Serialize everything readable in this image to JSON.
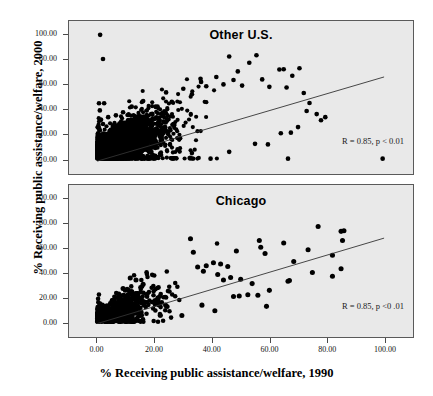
{
  "figure": {
    "xlabel": "% Receiving public assistance/welfare, 1990",
    "ylabel": "% Receiving public assistance/welfare, 2000"
  },
  "chart_data": {
    "type": "scatter",
    "title": "",
    "xlabel": "% Receiving public assistance/welfare, 1990",
    "ylabel": "% Receiving public assistance/welfare, 2000",
    "xlim": [
      -5,
      108
    ],
    "ylim": [
      -6,
      108
    ],
    "xticks": [
      "0.00",
      "20.00",
      "40.00",
      "60.00",
      "80.00",
      "100.00"
    ],
    "xtick_values": [
      0,
      20,
      40,
      60,
      80,
      100
    ],
    "yticks": [
      "0.00",
      "20.00",
      "40.00",
      "60.00",
      "80.00",
      "100.00"
    ],
    "ytick_values": [
      0,
      20,
      40,
      60,
      80,
      100
    ],
    "grid": false,
    "legend": "none",
    "panels": [
      {
        "name": "other-us",
        "title": "Other U.S.",
        "annotation": "R = 0.85, p < 0.01",
        "r": 0.85,
        "p_text": "p < 0.01",
        "n_points": 2600,
        "fit_line": {
          "x0": 0,
          "y0": -2.0,
          "x1": 100,
          "y1": 66.0
        },
        "marker_color": "#000000",
        "marker_size": 2.1,
        "cloud": {
          "x_mode": 11,
          "x_spread": 13,
          "x_max": 100,
          "slope": 0.72,
          "intercept": 6.5,
          "residual_sd": 7.2
        },
        "outliers": [
          [
            1.0,
            100.0
          ],
          [
            2.0,
            80.5
          ],
          [
            0.6,
            44.8
          ],
          [
            2.4,
            44.8
          ],
          [
            0.9,
            39.0
          ],
          [
            1.2,
            31.5
          ],
          [
            3.8,
            33.5
          ],
          [
            2.0,
            28.0
          ],
          [
            6.5,
            35.0
          ],
          [
            9.0,
            37.5
          ],
          [
            12.0,
            42.0
          ],
          [
            16.0,
            46.5
          ],
          [
            21.0,
            42.0
          ],
          [
            24.0,
            53.5
          ],
          [
            26.0,
            46.0
          ],
          [
            30.0,
            56.5
          ],
          [
            33.0,
            52.0
          ],
          [
            36.0,
            64.5
          ],
          [
            36.2,
            62.0
          ],
          [
            38.0,
            58.5
          ],
          [
            41.5,
            66.0
          ],
          [
            44.0,
            60.0
          ],
          [
            46.0,
            82.5
          ],
          [
            47.5,
            63.5
          ],
          [
            49.0,
            70.5
          ],
          [
            50.5,
            59.0
          ],
          [
            53.0,
            77.5
          ],
          [
            55.5,
            83.5
          ],
          [
            57.5,
            64.0
          ],
          [
            60.0,
            58.0
          ],
          [
            63.5,
            72.0
          ],
          [
            65.0,
            72.2
          ],
          [
            68.0,
            67.0
          ],
          [
            70.5,
            73.0
          ],
          [
            66.0,
            57.5
          ],
          [
            72.0,
            53.0
          ],
          [
            74.0,
            45.0
          ],
          [
            76.5,
            36.0
          ],
          [
            78.0,
            31.0
          ],
          [
            79.5,
            33.5
          ],
          [
            73.0,
            38.5
          ],
          [
            70.0,
            25.5
          ],
          [
            67.5,
            21.0
          ],
          [
            64.0,
            20.5
          ],
          [
            59.5,
            11.5
          ],
          [
            55.0,
            12.0
          ],
          [
            46.0,
            5.5
          ],
          [
            39.5,
            0.0
          ],
          [
            66.5,
            0.0
          ],
          [
            99.5,
            0.0
          ],
          [
            33.0,
            4.5
          ],
          [
            28.0,
            7.5
          ],
          [
            22.0,
            3.0
          ],
          [
            17.5,
            2.0
          ],
          [
            12.5,
            1.5
          ]
        ]
      },
      {
        "name": "chicago",
        "title": "Chicago",
        "annotation": "R = 0.85, p <0 .01",
        "r": 0.85,
        "p_text": "p <0 .01",
        "n_points": 520,
        "fit_line": {
          "x0": 0,
          "y0": -1.5,
          "x1": 100,
          "y1": 68.0
        },
        "marker_color": "#000000",
        "marker_size": 2.3,
        "cloud": {
          "x_mode": 9,
          "x_spread": 12,
          "x_max": 90,
          "slope": 0.7,
          "intercept": 4.0,
          "residual_sd": 6.0
        },
        "outliers": [
          [
            32.5,
            67.5
          ],
          [
            33.5,
            56.5
          ],
          [
            48.5,
            57.5
          ],
          [
            56.5,
            66.0
          ],
          [
            57.0,
            60.5
          ],
          [
            58.5,
            55.5
          ],
          [
            65.0,
            64.0
          ],
          [
            73.5,
            58.5
          ],
          [
            77.0,
            77.5
          ],
          [
            82.0,
            54.0
          ],
          [
            85.0,
            73.5
          ],
          [
            86.0,
            74.0
          ],
          [
            85.5,
            66.0
          ],
          [
            85.0,
            43.0
          ],
          [
            82.0,
            37.0
          ],
          [
            75.0,
            40.0
          ],
          [
            67.0,
            33.5
          ],
          [
            66.5,
            33.0
          ],
          [
            68.5,
            49.0
          ],
          [
            60.0,
            25.5
          ],
          [
            59.0,
            12.5
          ],
          [
            56.0,
            21.5
          ],
          [
            52.5,
            22.0
          ],
          [
            49.5,
            21.0
          ],
          [
            47.5,
            20.5
          ],
          [
            44.0,
            34.0
          ],
          [
            41.0,
            9.0
          ],
          [
            36.5,
            13.5
          ],
          [
            29.5,
            5.0
          ],
          [
            24.0,
            13.0
          ],
          [
            20.5,
            14.5
          ],
          [
            16.0,
            30.5
          ],
          [
            13.5,
            34.0
          ],
          [
            11.5,
            35.5
          ],
          [
            9.0,
            27.0
          ],
          [
            12.0,
            24.5
          ],
          [
            14.0,
            23.0
          ],
          [
            7.5,
            22.5
          ],
          [
            5.5,
            17.0
          ],
          [
            3.0,
            11.0
          ],
          [
            38.0,
            45.5
          ],
          [
            40.5,
            48.0
          ],
          [
            43.0,
            47.0
          ],
          [
            45.5,
            45.0
          ],
          [
            35.0,
            44.5
          ],
          [
            37.0,
            41.0
          ],
          [
            42.0,
            38.5
          ],
          [
            46.5,
            36.0
          ],
          [
            50.0,
            34.5
          ],
          [
            54.0,
            31.0
          ]
        ]
      }
    ]
  }
}
